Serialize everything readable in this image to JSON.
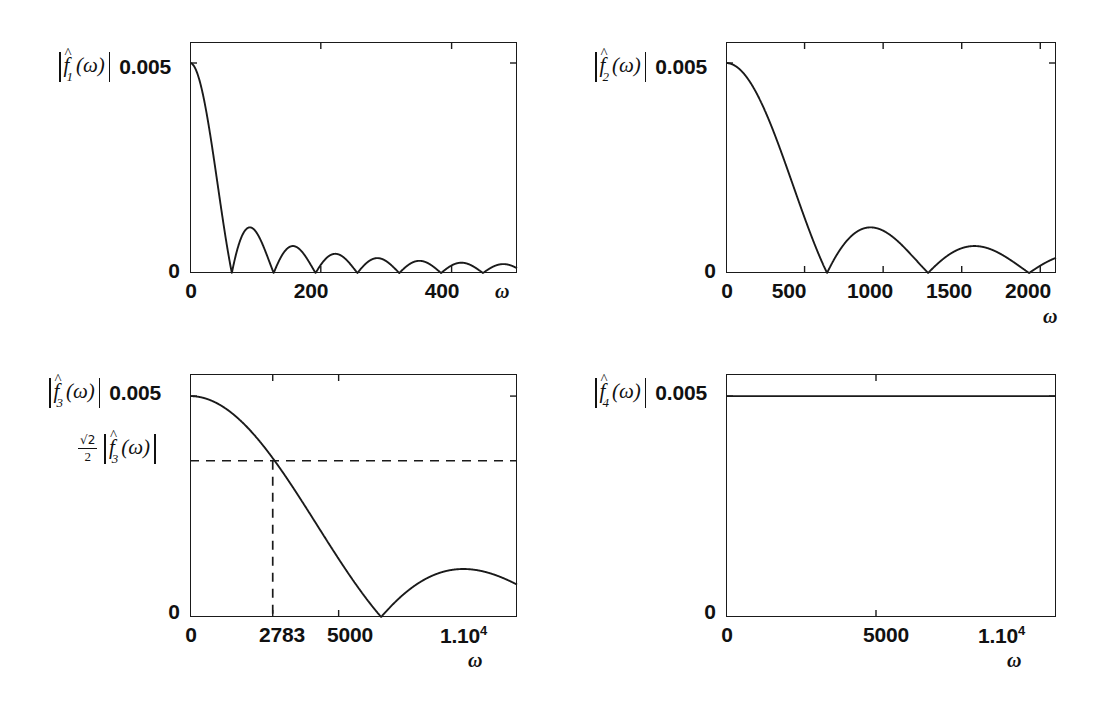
{
  "figure": {
    "background": "#ffffff",
    "ink": "#1a1a1a"
  },
  "chart_data": [
    {
      "id": "panel-1",
      "type": "line",
      "title": "",
      "ylabel": "|f̂1(ω)|",
      "xlabel": "ω",
      "function_name": "f̂1",
      "function_index": "1",
      "xlim": [
        0,
        500
      ],
      "ylim": [
        0,
        0.0055
      ],
      "grid": false,
      "legend": null,
      "xticks": [
        0,
        200,
        400
      ],
      "xticklabels": [
        "0",
        "200",
        "400"
      ],
      "yticks": [
        0,
        0.005
      ],
      "yticklabels": [
        "0",
        "0.005"
      ],
      "peak_value": 0.005,
      "first_zero": 64,
      "lobe_period": 64,
      "envelope": "sinc",
      "description": "Magnitude of sinc-shaped spectrum, main lobe 0 to 64, many decaying side lobes out to 500",
      "x": [
        0,
        10,
        20,
        30,
        40,
        50,
        64,
        80,
        96,
        128,
        160,
        192,
        224,
        256,
        288,
        320,
        352,
        384,
        416,
        448,
        480,
        500
      ],
      "y": [
        0.005,
        0.00487,
        0.0045,
        0.00392,
        0.00317,
        0.00232,
        0.0,
        0.00104,
        0.0,
        0.0,
        0.00062,
        0.0,
        0.00045,
        0.0,
        0.00035,
        0.0,
        0.00029,
        0.0,
        0.00025,
        0.0,
        0.00022,
        0.00012
      ]
    },
    {
      "id": "panel-2",
      "type": "line",
      "title": "",
      "ylabel": "|f̂2(ω)|",
      "xlabel": "ω",
      "function_name": "f̂2",
      "function_index": "2",
      "xlim": [
        0,
        2100
      ],
      "ylim": [
        0,
        0.0055
      ],
      "grid": false,
      "legend": null,
      "xticks": [
        0,
        500,
        1000,
        1500,
        2000
      ],
      "xticklabels": [
        "0",
        "500",
        "1000",
        "1500",
        "2000"
      ],
      "yticks": [
        0,
        0.005
      ],
      "yticklabels": [
        "0",
        "0.005"
      ],
      "peak_value": 0.005,
      "first_zero": 643,
      "lobe_period": 643,
      "envelope": "sinc",
      "description": "Magnitude of sinc-shaped spectrum with zeros near 643, 1286, 1929",
      "x": [
        0,
        100,
        200,
        300,
        400,
        500,
        600,
        643,
        750,
        900,
        1000,
        1150,
        1286,
        1400,
        1550,
        1700,
        1850,
        1929,
        2000,
        2100
      ],
      "y": [
        0.005,
        0.00487,
        0.0045,
        0.00392,
        0.00317,
        0.00232,
        0.00075,
        0.0,
        0.00075,
        0.00106,
        0.00098,
        0.00055,
        0.0,
        0.00045,
        0.00063,
        0.00052,
        0.00022,
        0.0,
        0.00028,
        0.00042
      ]
    },
    {
      "id": "panel-3",
      "type": "line",
      "title": "",
      "ylabel": "|f̂3(ω)|",
      "xlabel": "ω",
      "function_name": "f̂3",
      "function_index": "3",
      "xlim": [
        0,
        11000
      ],
      "ylim": [
        0,
        0.0055
      ],
      "grid": false,
      "legend": null,
      "xticks": [
        0,
        2783,
        5000,
        11000
      ],
      "xticklabels": [
        "0",
        "2783",
        "5000",
        "1.10"
      ],
      "xtick_exponent": "4",
      "yticks": [
        0,
        0.005
      ],
      "yticklabels": [
        "0",
        "0.005"
      ],
      "peak_value": 0.005,
      "first_zero": 6430,
      "envelope": "sinc",
      "cutoff": {
        "omega": 2783,
        "label_fraction_numerator": "√2",
        "label_fraction_denominator": "2",
        "label_magnitude": "|f̂3(ω)|",
        "value": 0.003536,
        "line_style": "dashed"
      },
      "description": "Magnitude spectrum with -3dB cutoff marked by dashed lines at omega = 2783, first zero near 6430",
      "x": [
        0,
        500,
        1000,
        1500,
        2000,
        2500,
        2783,
        3200,
        3800,
        4400,
        5000,
        5600,
        6000,
        6430,
        7000,
        7800,
        8600,
        9400,
        10200,
        11000
      ],
      "y": [
        0.005,
        0.00489,
        0.00457,
        0.00408,
        0.00345,
        0.00273,
        0.003536,
        0.00196,
        0.00145,
        0.00097,
        0.00062,
        0.00032,
        0.00016,
        0.0,
        0.00036,
        0.00072,
        0.00097,
        0.00112,
        0.00118,
        0.00116
      ]
    },
    {
      "id": "panel-4",
      "type": "line",
      "title": "",
      "ylabel": "|f̂4(ω)|",
      "xlabel": "ω",
      "function_name": "f̂4",
      "function_index": "4",
      "xlim": [
        0,
        11000
      ],
      "ylim": [
        0,
        0.0055
      ],
      "grid": false,
      "legend": null,
      "xticks": [
        0,
        5000,
        11000
      ],
      "xticklabels": [
        "0",
        "5000",
        "1.10"
      ],
      "xtick_exponent": "4",
      "yticks": [
        0,
        0.005
      ],
      "yticklabels": [
        "0",
        "0.005"
      ],
      "peak_value": 0.005,
      "envelope": "constant",
      "description": "Flat constant magnitude spectrum at 0.005 across the full frequency range",
      "x": [
        0,
        2000,
        4000,
        6000,
        8000,
        11000
      ],
      "y": [
        0.005,
        0.005,
        0.005,
        0.005,
        0.005,
        0.005
      ]
    }
  ]
}
